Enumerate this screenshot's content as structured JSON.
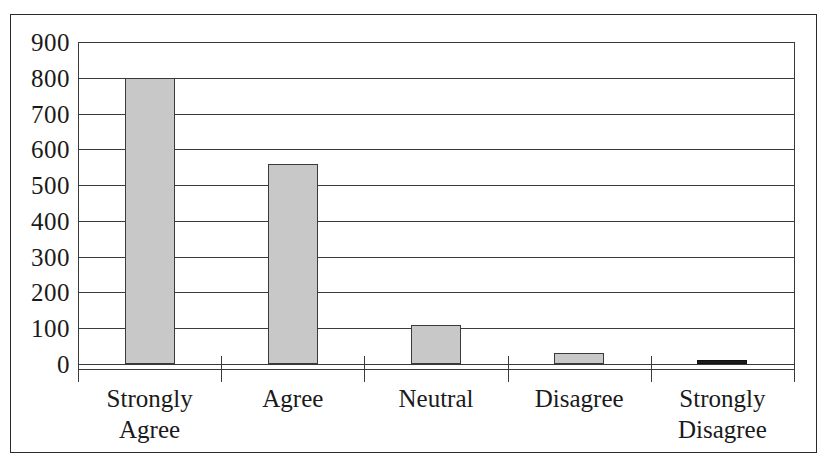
{
  "chart_data": {
    "type": "bar",
    "title": "",
    "subtitle": "",
    "xlabel": "",
    "ylabel": "",
    "categories": [
      "Strongly Agree",
      "Agree",
      "Neutral",
      "Disagree",
      "Strongly Disagree"
    ],
    "category_lines": [
      [
        "Strongly",
        "Agree"
      ],
      [
        "Agree",
        ""
      ],
      [
        "Neutral",
        ""
      ],
      [
        "Disagree",
        ""
      ],
      [
        "Strongly",
        "Disagree"
      ]
    ],
    "values": [
      800,
      560,
      110,
      32,
      5
    ],
    "ylim": [
      0,
      900
    ],
    "ytick_values": [
      900,
      800,
      700,
      600,
      500,
      400,
      300,
      200,
      100,
      0
    ],
    "ytick_labels": [
      "900",
      "800",
      "700",
      "600",
      "500",
      "400",
      "300",
      "200",
      "100",
      "0"
    ],
    "ytick_step": 100,
    "grid": true,
    "grid_axis": "y",
    "legend": false,
    "legend_position": "none",
    "annotations": [],
    "bar_fill_color": "#c8c8c8",
    "bar_edge_color": "#3a3a3a",
    "tiny_bar_color": "#1c1c1c",
    "background_color": "#ffffff",
    "frame_color": "#2b2b2b"
  }
}
